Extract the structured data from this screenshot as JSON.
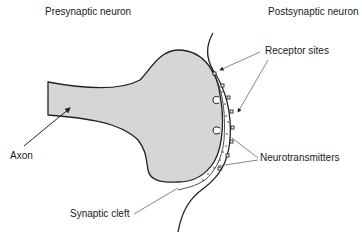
{
  "diagram": {
    "type": "synapse",
    "labels": {
      "presynaptic": "Presynaptic neuron",
      "postsynaptic": "Postsynaptic neuron",
      "receptor_sites": "Receptor sites",
      "axon": "Axon",
      "neurotransmitters": "Neurotransmitters",
      "synaptic_cleft": "Synaptic cleft"
    },
    "colors": {
      "terminal_fill": "#d6d6d6",
      "outline": "#222222",
      "leader_line": "#555555",
      "text": "#1a1a1a"
    }
  }
}
